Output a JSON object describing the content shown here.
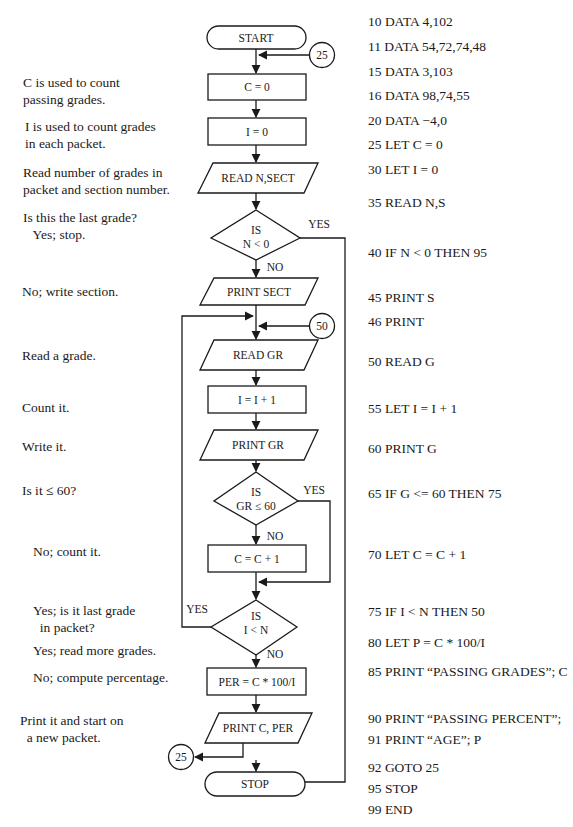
{
  "annotations": [
    {
      "id": "c-purpose",
      "lines": [
        "C is used to count",
        "passing grades."
      ],
      "x": 23,
      "y": 74
    },
    {
      "id": "i-purpose",
      "lines": [
        "I is used to count grades",
        "in each packet."
      ],
      "x": 25,
      "y": 118
    },
    {
      "id": "read-n",
      "lines": [
        "Read number of grades in",
        "packet and section number."
      ],
      "x": 23,
      "y": 164
    },
    {
      "id": "last-grade",
      "lines": [
        "Is this the last grade?",
        "   Yes; stop."
      ],
      "x": 23,
      "y": 209
    },
    {
      "id": "write-section",
      "lines": [
        "No; write section."
      ],
      "x": 22,
      "y": 283
    },
    {
      "id": "read-grade",
      "lines": [
        "Read a grade."
      ],
      "x": 22,
      "y": 347
    },
    {
      "id": "count-it",
      "lines": [
        "Count it."
      ],
      "x": 22,
      "y": 399
    },
    {
      "id": "write-it",
      "lines": [
        "Write it."
      ],
      "x": 22,
      "y": 438
    },
    {
      "id": "is-le-60",
      "lines": [
        "Is it ≤ 60?"
      ],
      "x": 22,
      "y": 482
    },
    {
      "id": "no-count",
      "lines": [
        "No; count it."
      ],
      "x": 33,
      "y": 543
    },
    {
      "id": "last-in-packet",
      "lines": [
        "Yes; is it last grade",
        "  in packet?"
      ],
      "x": 33,
      "y": 602
    },
    {
      "id": "read-more",
      "lines": [
        "Yes; read more grades."
      ],
      "x": 33,
      "y": 642
    },
    {
      "id": "compute-pct",
      "lines": [
        "No; compute percentage."
      ],
      "x": 33,
      "y": 669
    },
    {
      "id": "print-restart",
      "lines": [
        "Print it and start on",
        "  a new packet."
      ],
      "x": 20,
      "y": 712
    }
  ],
  "program": [
    {
      "line": "10 DATA 4,102",
      "y": 19
    },
    {
      "line": "11 DATA 54,72,74,48",
      "y": 44
    },
    {
      "line": "15 DATA 3,103",
      "y": 69
    },
    {
      "line": "16 DATA 98,74,55",
      "y": 93
    },
    {
      "line": "20 DATA −4,0",
      "y": 118
    },
    {
      "line": "25 LET C = 0",
      "y": 142
    },
    {
      "line": "30 LET I = 0",
      "y": 167
    },
    {
      "line": "35 READ N,S",
      "y": 200
    },
    {
      "line": "40 IF N < 0 THEN 95",
      "y": 250
    },
    {
      "line": "45 PRINT S",
      "y": 295
    },
    {
      "line": "46 PRINT",
      "y": 319
    },
    {
      "line": "50 READ G",
      "y": 359
    },
    {
      "line": "55 LET I = I + 1",
      "y": 406
    },
    {
      "line": "60 PRINT G",
      "y": 446
    },
    {
      "line": "65 IF G <= 60 THEN 75",
      "y": 491
    },
    {
      "line": "70 LET C = C + 1",
      "y": 552
    },
    {
      "line": "75 IF I < N THEN 50",
      "y": 609
    },
    {
      "line": "80 LET P = C * 100/I",
      "y": 640
    },
    {
      "line": "85 PRINT “PASSING GRADES”; C",
      "y": 669
    },
    {
      "line": "90 PRINT “PASSING PERCENT”;",
      "y": 716
    },
    {
      "line": "91 PRINT “AGE”; P",
      "y": 737
    },
    {
      "line": "92 GOTO 25",
      "y": 765
    },
    {
      "line": "95 STOP",
      "y": 786
    },
    {
      "line": "99 END",
      "y": 807
    }
  ],
  "flowchart": {
    "start": "START",
    "connector_top": "25",
    "c_init": "C = 0",
    "i_init": "I = 0",
    "read_n": "READ N,SECT",
    "dec1_line1": "IS",
    "dec1_line2": "N < 0",
    "dec1_yes": "YES",
    "dec1_no": "NO",
    "print_sect": "PRINT SECT",
    "connector_loop": "50",
    "read_gr": "READ GR",
    "incr_i": "I = I + 1",
    "print_gr": "PRINT GR",
    "dec2_line1": "IS",
    "dec2_line2": "GR ≤ 60",
    "dec2_yes": "YES",
    "dec2_no": "NO",
    "incr_c": "C = C + 1",
    "dec3_line1": "IS",
    "dec3_line2": "I < N",
    "dec3_yes": "YES",
    "dec3_no": "NO",
    "compute_per": "PER = C * 100/I",
    "print_result": "PRINT C, PER",
    "connector_bottom": "25",
    "stop": "STOP"
  }
}
